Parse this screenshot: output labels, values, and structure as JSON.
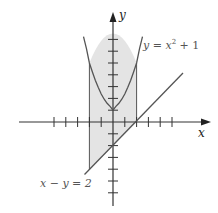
{
  "diagram": {
    "type": "region-between-curves",
    "axes": {
      "x_label": "x",
      "y_label": "y",
      "origin_px": [
        113,
        122
      ],
      "unit_px": 11.8,
      "x_ticks": [
        -5,
        -4,
        -3,
        -2,
        -1,
        1,
        2,
        3,
        4,
        5
      ],
      "y_ticks": [
        -7,
        -6,
        -5,
        -4,
        -3,
        -2,
        -1,
        1,
        2,
        3,
        4,
        5,
        6,
        7
      ]
    },
    "curves": [
      {
        "name": "parabola",
        "equation_label": "y = x",
        "exponent": "2",
        "suffix": " + 1"
      },
      {
        "name": "line",
        "equation_label": "x − y = 2"
      }
    ],
    "shaded_region": {
      "x_from": -2,
      "x_to": 2,
      "upper": "y = x^2 + 1",
      "lower": "y = x - 2",
      "fill": "#e4e4e4"
    },
    "colors": {
      "stroke": "#333333",
      "curve": "#555555",
      "fill": "#e4e4e4"
    }
  },
  "labels": {
    "y_axis": "y",
    "x_axis": "x",
    "parabola_prefix": "y = x",
    "parabola_exp": "2",
    "parabola_suffix": " + 1",
    "line_eq": "x − y = 2"
  }
}
